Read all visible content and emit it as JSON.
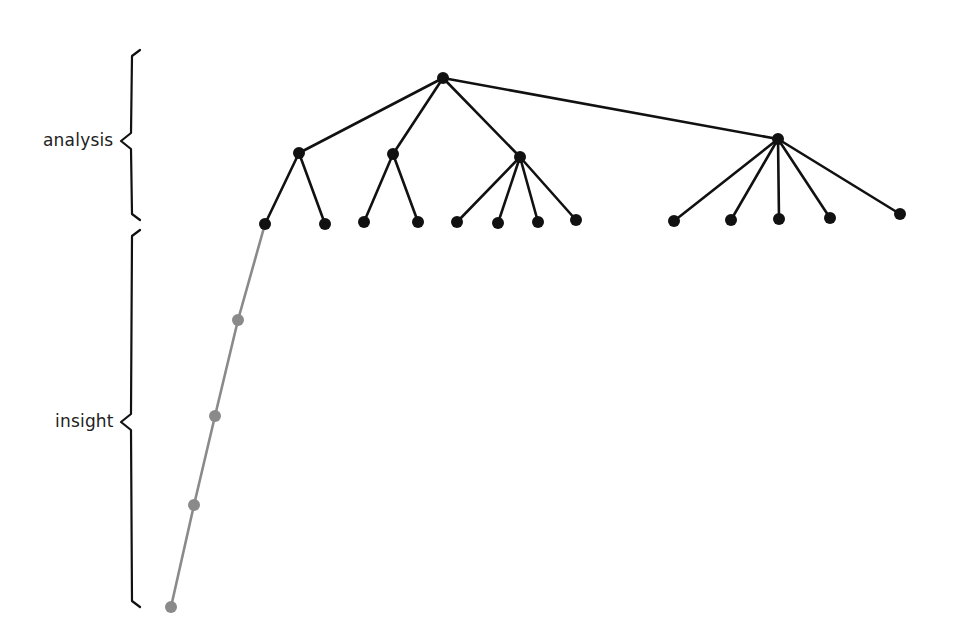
{
  "labels": {
    "analysis": "analysis",
    "insight": "insight"
  },
  "colors": {
    "tree": "#111111",
    "insight_path": "#8a8a8a",
    "brace": "#111111",
    "text": "#222222"
  },
  "braces": [
    {
      "name": "analysis-brace",
      "x": 131,
      "top": 50,
      "tip_y": 141,
      "bottom": 220,
      "tip_x": 121
    },
    {
      "name": "insight-brace",
      "x": 131,
      "top": 230,
      "tip_y": 422,
      "bottom": 607,
      "tip_x": 121
    }
  ],
  "tree": {
    "nodes": [
      {
        "id": "root",
        "x": 443,
        "y": 78,
        "r": 6
      },
      {
        "id": "a",
        "x": 299,
        "y": 153,
        "r": 6
      },
      {
        "id": "b",
        "x": 393,
        "y": 154,
        "r": 6
      },
      {
        "id": "c",
        "x": 520,
        "y": 157,
        "r": 6
      },
      {
        "id": "d",
        "x": 778,
        "y": 139,
        "r": 6
      },
      {
        "id": "a1",
        "x": 265,
        "y": 224,
        "r": 6
      },
      {
        "id": "a2",
        "x": 325,
        "y": 224,
        "r": 6
      },
      {
        "id": "b1",
        "x": 364,
        "y": 222,
        "r": 6
      },
      {
        "id": "b2",
        "x": 418,
        "y": 222,
        "r": 6
      },
      {
        "id": "c1",
        "x": 457,
        "y": 222,
        "r": 6
      },
      {
        "id": "c2",
        "x": 498,
        "y": 223,
        "r": 6
      },
      {
        "id": "c3",
        "x": 538,
        "y": 222,
        "r": 6
      },
      {
        "id": "c4",
        "x": 576,
        "y": 220,
        "r": 6
      },
      {
        "id": "d1",
        "x": 674,
        "y": 221,
        "r": 6
      },
      {
        "id": "d2",
        "x": 731,
        "y": 220,
        "r": 6
      },
      {
        "id": "d3",
        "x": 779,
        "y": 219,
        "r": 6
      },
      {
        "id": "d4",
        "x": 830,
        "y": 218,
        "r": 6
      },
      {
        "id": "d5",
        "x": 900,
        "y": 214,
        "r": 6
      }
    ],
    "edges": [
      [
        "root",
        "a"
      ],
      [
        "root",
        "b"
      ],
      [
        "root",
        "c"
      ],
      [
        "root",
        "d"
      ],
      [
        "a",
        "a1"
      ],
      [
        "a",
        "a2"
      ],
      [
        "b",
        "b1"
      ],
      [
        "b",
        "b2"
      ],
      [
        "c",
        "c1"
      ],
      [
        "c",
        "c2"
      ],
      [
        "c",
        "c3"
      ],
      [
        "c",
        "c4"
      ],
      [
        "d",
        "d1"
      ],
      [
        "d",
        "d2"
      ],
      [
        "d",
        "d3"
      ],
      [
        "d",
        "d4"
      ],
      [
        "d",
        "d5"
      ]
    ]
  },
  "insight_path": {
    "start_node": "a1",
    "points": [
      {
        "x": 265,
        "y": 224
      },
      {
        "x": 238,
        "y": 320
      },
      {
        "x": 215,
        "y": 416
      },
      {
        "x": 194,
        "y": 505
      },
      {
        "x": 171,
        "y": 607
      }
    ]
  }
}
